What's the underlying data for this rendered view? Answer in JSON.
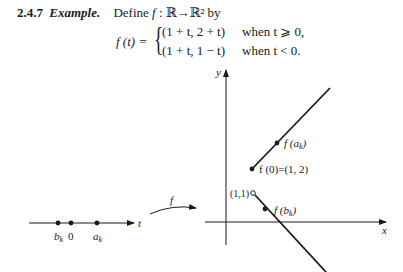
{
  "heading": {
    "number": "2.4.7",
    "title": "Example.",
    "definition_prefix": "Define ",
    "definition_f": "f",
    "definition_rest": " : ℝ→ℝ² by"
  },
  "formula": {
    "lhs": "f (t) =",
    "cases": [
      {
        "expr": "(1 + t, 2 + t)",
        "condition": "when t ⩾ 0,"
      },
      {
        "expr": "(1 + t, 1 − t)",
        "condition": "when t < 0."
      }
    ]
  },
  "domain_line": {
    "axis_label": "t",
    "points": [
      {
        "label": "b",
        "subscript": "k",
        "x": 58
      },
      {
        "label": "0",
        "subscript": "",
        "x": 71
      },
      {
        "label": "a",
        "subscript": "k",
        "x": 97
      }
    ]
  },
  "map_arrow": {
    "label": "f"
  },
  "plane": {
    "x_axis_label": "x",
    "y_axis_label": "y",
    "labels": {
      "f_a_k": "f (a",
      "f_a_k_sub": "k",
      "f_a_k_close": ")",
      "f_zero": "f (0)=(1, 2)",
      "f_b_k": "f (b",
      "f_b_k_sub": "k",
      "f_b_k_close": ")",
      "open_point": "(1,1)"
    }
  },
  "colors": {
    "ink": "#1a1a1a",
    "background": "#ffffff"
  }
}
